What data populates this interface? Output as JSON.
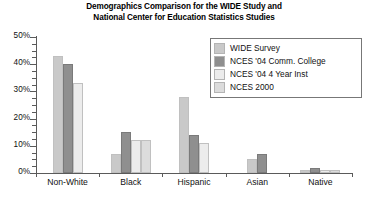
{
  "chart_data": {
    "type": "bar",
    "title": "Demographics Comparison for the WIDE Study and National Center for Education Statistics Studies",
    "title_line1": "Demographics Comparison for the WIDE Study and",
    "title_line2": "National Center for Education Statistics Studies",
    "xlabel": "",
    "ylabel": "",
    "ylim": [
      0,
      50
    ],
    "ytick_labels": [
      "0%",
      "10%",
      "20%",
      "30%",
      "40%",
      "50%"
    ],
    "ytick_values": [
      0,
      10,
      20,
      30,
      40,
      50
    ],
    "yminor_step": 2.5,
    "grid": false,
    "legend_position": "top-right",
    "categories": [
      "Non-White",
      "Black",
      "Hispanic",
      "Asian",
      "Native"
    ],
    "series": [
      {
        "name": "WIDE Survey",
        "color": "#c9c9c9",
        "values": [
          43,
          7,
          28,
          5,
          1.2
        ]
      },
      {
        "name": "NCES '04 Comm. College",
        "color": "#8f8f8f",
        "values": [
          40,
          15,
          14,
          7,
          1.8
        ]
      },
      {
        "name": "NCES '04 4 Year Inst",
        "color": "#ececec",
        "values": [
          33,
          12,
          11,
          0,
          1.0
        ]
      },
      {
        "name": "NCES 2000",
        "color": "#dcdcdc",
        "values": [
          0,
          12,
          0,
          0,
          1.0
        ]
      }
    ]
  },
  "legend": {
    "items": [
      {
        "label": "WIDE Survey",
        "color": "#c9c9c9"
      },
      {
        "label": "NCES '04 Comm. College",
        "color": "#8f8f8f"
      },
      {
        "label": "NCES '04 4 Year Inst",
        "color": "#ececec"
      },
      {
        "label": "NCES 2000",
        "color": "#dcdcdc"
      }
    ]
  },
  "axis": {
    "y_labels": [
      "50%",
      "40%",
      "30%",
      "20%",
      "10%",
      "0%"
    ],
    "x_labels": [
      "Non-White",
      "Black",
      "Hispanic",
      "Asian",
      "Native"
    ]
  }
}
